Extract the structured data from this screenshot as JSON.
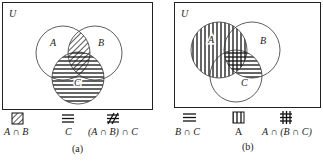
{
  "figure_a": {
    "universe_label": "U",
    "sets": [
      {
        "label": "A",
        "cx": 63,
        "cy": 53,
        "r": 27
      },
      {
        "label": "B",
        "cx": 95,
        "cy": 53,
        "r": 27
      },
      {
        "label": "C",
        "cx": 78,
        "cy": 78,
        "r": 26
      }
    ],
    "legend": [
      {
        "pattern": "diagonal-hatch",
        "label": "A ∩ B"
      },
      {
        "pattern": "horizontal-lines",
        "label": "C"
      },
      {
        "pattern": "cross-hatch",
        "label": "(A ∩ B) ∩ C"
      }
    ],
    "caption": "(a)"
  },
  "figure_b": {
    "universe_label": "U",
    "sets": [
      {
        "label": "A",
        "cx": 219,
        "cy": 50,
        "r": 28
      },
      {
        "label": "B",
        "cx": 252,
        "cy": 50,
        "r": 28
      },
      {
        "label": "C",
        "cx": 236,
        "cy": 76,
        "r": 26
      }
    ],
    "legend": [
      {
        "pattern": "horizontal-lines",
        "label": "B ∩ C"
      },
      {
        "pattern": "vertical-lines",
        "label": "A"
      },
      {
        "pattern": "grid-hatch",
        "label": "A ∩ (B ∩ C)"
      }
    ],
    "caption": "(b)"
  }
}
